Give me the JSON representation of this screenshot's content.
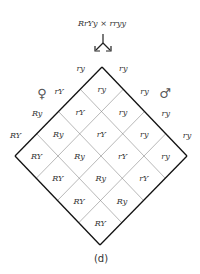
{
  "cross": "RrYy × rryy",
  "caption": "(d)",
  "female_symbol": "♀",
  "male_symbol": "♂",
  "female_gametes": [
    "ry",
    "rY",
    "Ry",
    "RY"
  ],
  "male_gametes": [
    "ry",
    "ry",
    "ry",
    "ry"
  ],
  "cells": [
    [
      "ry",
      "ry",
      "ry",
      "ry"
    ],
    [
      "rY",
      "rY",
      "rY",
      "rY"
    ],
    [
      "Ry",
      "Ry",
      "Ry",
      "Ry"
    ],
    [
      "RY",
      "RY",
      "RY",
      "RY"
    ]
  ]
}
